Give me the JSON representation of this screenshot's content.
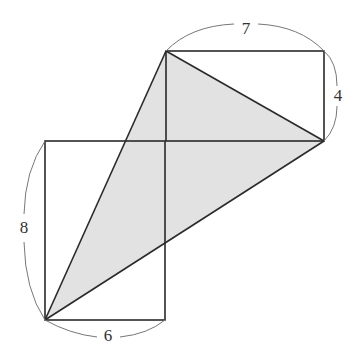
{
  "diagram": {
    "colors": {
      "stroke": "#2a2a2a",
      "shade": "#e2e2e2",
      "arc": "#777777",
      "background": "#ffffff"
    },
    "rectangles": [
      {
        "name": "lower-left-rectangle",
        "width_units": 6,
        "height_units": 8,
        "x": 45,
        "y": 141,
        "w": 120,
        "h": 179
      },
      {
        "name": "upper-right-rectangle",
        "width_units": 7,
        "height_units": 4,
        "x": 166,
        "y": 51,
        "w": 158,
        "h": 90
      }
    ],
    "shaded_triangle": {
      "points": [
        [
          45,
          320
        ],
        [
          166,
          51
        ],
        [
          324,
          141
        ]
      ]
    },
    "labels": {
      "top_width": "7",
      "right_height": "4",
      "left_height": "8",
      "bottom_width": "6"
    }
  }
}
